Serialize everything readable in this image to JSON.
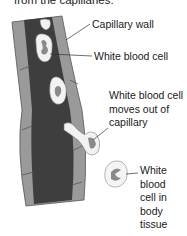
{
  "intro_text": "from the capillaries.",
  "labels": {
    "capillary_wall": "Capillary wall",
    "wbc": "White blood cell",
    "moves_out": [
      "White blood cell",
      "moves out of",
      "capillary"
    ],
    "in_tissue": [
      "White",
      "blood",
      "cell in",
      "body",
      "tissue"
    ]
  },
  "colors": {
    "wall_light": "#9a9a9a",
    "wall_mid": "#7c7c7c",
    "lumen": "#3e3e3e",
    "cell_fill": "#f2f2f2",
    "nucleus": "#8a8a8a"
  }
}
